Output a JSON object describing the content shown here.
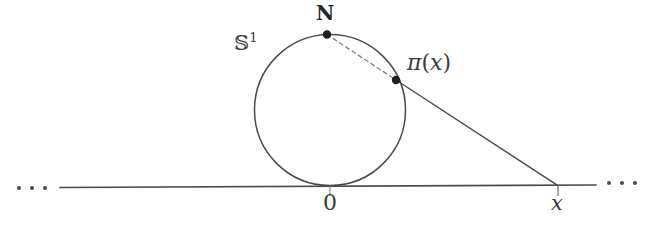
{
  "figure": {
    "background_color": "#ffffff",
    "stroke_color": "#4a4a4a",
    "label_color": "#3a3a3a",
    "width": 661,
    "height": 235
  },
  "labels": {
    "sphere": "𝕊",
    "sphere_superscript": "1",
    "north_pole": "N",
    "projection_pi": "π",
    "projection_open_paren": "(",
    "projection_arg": "x",
    "projection_close_paren": ")",
    "origin": "0",
    "x_point": "x"
  },
  "geometry": {
    "circle": {
      "cx": 330,
      "cy": 110,
      "r": 75.5
    },
    "axis_line": {
      "x1": 60,
      "y1": 187.5,
      "x2": 596,
      "y2": 185
    },
    "north_point": {
      "x": 327,
      "y": 34.5
    },
    "projection_point": {
      "x": 396,
      "y": 80
    },
    "x_axis_point": {
      "x": 558,
      "y": 185.6
    },
    "ray_pi_to_x": {
      "x1": 396,
      "y1": 80,
      "x2": 558,
      "y2": 185.6
    },
    "chord_n_to_pi": {
      "x1": 327,
      "y1": 34.5,
      "x2": 396,
      "y2": 80
    },
    "tick_origin": {
      "x": 330,
      "y1": 186,
      "y2": 196
    },
    "tick_x": {
      "x": 558,
      "y1": 185,
      "y2": 196
    }
  },
  "ellipsis": {
    "dot_count": 3,
    "left_label": "...",
    "right_label": "..."
  }
}
